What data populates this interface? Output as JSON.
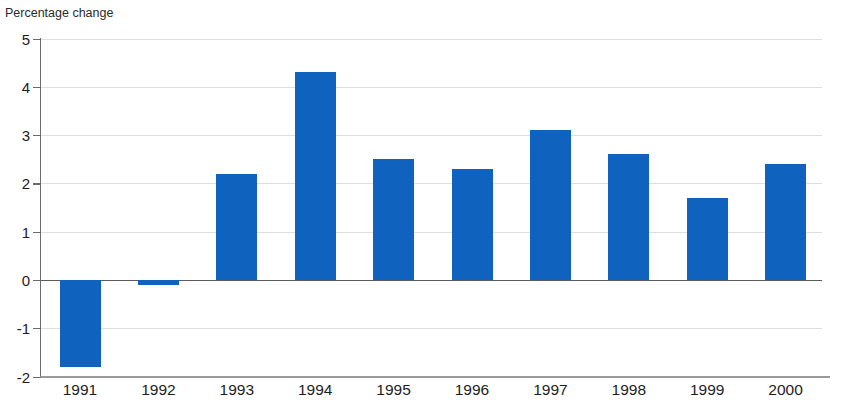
{
  "headline": {
    "text": "",
    "color": "#27408b",
    "clipped": true
  },
  "axis_caption": "Percentage change",
  "chart_data": {
    "type": "bar",
    "title": "",
    "subtitle": "",
    "xlabel": "",
    "ylabel": "Percentage change",
    "categories": [
      "1991",
      "1992",
      "1993",
      "1994",
      "1995",
      "1996",
      "1997",
      "1998",
      "1999",
      "2000"
    ],
    "values": [
      -1.8,
      -0.1,
      2.2,
      4.3,
      2.5,
      2.3,
      3.1,
      2.6,
      1.7,
      2.4
    ],
    "series": [
      {
        "name": "Percentage change",
        "values": [
          -1.8,
          -0.1,
          2.2,
          4.3,
          2.5,
          2.3,
          3.1,
          2.6,
          1.7,
          2.4
        ],
        "color": "#0f63be"
      }
    ],
    "ylim": [
      -2,
      5
    ],
    "yticks": [
      5,
      4,
      3,
      2,
      1,
      0,
      -1,
      -2
    ],
    "ytick_labels": [
      "5",
      "4",
      "3",
      "2",
      "1",
      "0",
      "-1",
      "-2"
    ],
    "grid": true,
    "grid_axis": "y",
    "legend": false,
    "legend_position": "none",
    "bar_color": "#0f63be",
    "zero_line": true,
    "annotations": []
  }
}
